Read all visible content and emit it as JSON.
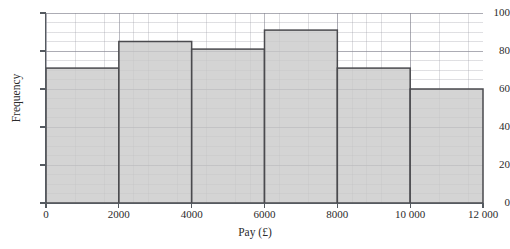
{
  "chart_data": {
    "type": "bar",
    "title": "",
    "subtitle": "",
    "xlabel": "Pay (£)",
    "ylabel": "Frequency",
    "xlim": [
      0,
      12000
    ],
    "ylim": [
      0,
      100
    ],
    "grid": true,
    "legend": "none",
    "bin_width": 2000,
    "bin_edges": [
      0,
      2000,
      4000,
      6000,
      8000,
      10000,
      12000
    ],
    "categories": [
      "0–2000",
      "2000–4000",
      "4000–6000",
      "6000–8000",
      "8000–10 000",
      "10 000–12 000"
    ],
    "values": [
      71,
      85,
      81,
      91,
      71,
      60
    ],
    "xticks": [
      0,
      2000,
      4000,
      6000,
      8000,
      10000,
      12000
    ],
    "xtick_labels": [
      "0",
      "2000",
      "4000",
      "6000",
      "8000",
      "10 000",
      "12 000"
    ],
    "yticks": [
      0,
      20,
      40,
      60,
      80,
      100
    ],
    "ytick_labels": [
      "0",
      "20",
      "40",
      "60",
      "80",
      "100"
    ],
    "bar_fill_color": "#c9c9c9",
    "bar_edge_color": "#4a4a4e",
    "grid_color": "#9aa0a6",
    "axis_color": "#555a60"
  }
}
